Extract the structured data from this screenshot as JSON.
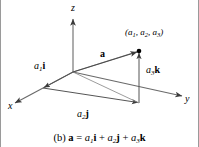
{
  "figure": {
    "label": "(b)",
    "background_color": "#ffffff",
    "line_color": "#3a3a3a",
    "text_color": "#000000",
    "border_color": "#9a9a9a",
    "width": 199,
    "height": 147
  },
  "axes": [
    {
      "id": "z",
      "label": "z",
      "label_x": 70,
      "label_y": 4
    },
    {
      "id": "x",
      "label": "x",
      "label_x": 8,
      "label_y": 102
    },
    {
      "id": "y",
      "label": "y",
      "label_x": 185,
      "label_y": 95
    }
  ],
  "point": {
    "name": "terminal-point",
    "label_prefix": "(",
    "label_a1": "a",
    "sub1": "1",
    "sep1": ", ",
    "label_a2": "a",
    "sub2": "2",
    "sep2": ", ",
    "label_a3": "a",
    "sub3": "3",
    "label_suffix": ")",
    "x": 138,
    "y": 51
  },
  "components": [
    {
      "id": "a1i",
      "scalar": "a",
      "sub": "1",
      "unit": "i",
      "label_x": 33,
      "label_y": 62
    },
    {
      "id": "a2j",
      "scalar": "a",
      "sub": "2",
      "unit": "j",
      "label_x": 76,
      "label_y": 110
    },
    {
      "id": "a3k",
      "scalar": "a",
      "sub": "3",
      "unit": "k",
      "label_x": 145,
      "label_y": 66
    }
  ],
  "vector": {
    "id": "a",
    "label": "a",
    "label_x": 99,
    "label_y": 50
  },
  "caption": {
    "part_label": "(b)",
    "vector": "a",
    "equals": "=",
    "term1_scalar": "a",
    "term1_sub": "1",
    "term1_unit": "i",
    "plus1": "+",
    "term2_scalar": "a",
    "term2_sub": "2",
    "term2_unit": "j",
    "plus2": "+",
    "term3_scalar": "a",
    "term3_sub": "3",
    "term3_unit": "k"
  }
}
